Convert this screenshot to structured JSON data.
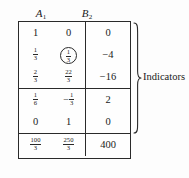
{
  "document": {
    "type": "simplex-tableau",
    "headers": [
      {
        "label": "A",
        "subscript": "1"
      },
      {
        "label": "B",
        "subscript": "2"
      }
    ],
    "annotation": {
      "label": "Indicators",
      "brace_side": "right"
    },
    "sections": [
      {
        "name": "indicator-rows",
        "rows": [
          {
            "a": {
              "text": "1"
            },
            "b": {
              "text": "0"
            },
            "rhs": {
              "text": "0"
            }
          },
          {
            "a": {
              "frac": {
                "num": "1",
                "den": "3"
              }
            },
            "b": {
              "frac": {
                "num": "1",
                "den": "3"
              },
              "circled": true
            },
            "rhs": {
              "text": "−4"
            }
          },
          {
            "a": {
              "frac": {
                "num": "2",
                "den": "3"
              }
            },
            "b": {
              "frac": {
                "num": "22",
                "den": "3"
              }
            },
            "rhs": {
              "text": "−16"
            }
          }
        ]
      },
      {
        "name": "basic-rows",
        "rows": [
          {
            "a": {
              "frac": {
                "num": "1",
                "den": "6"
              }
            },
            "b": {
              "neg": "−",
              "frac": {
                "num": "1",
                "den": "3"
              }
            },
            "rhs": {
              "text": "2"
            }
          },
          {
            "a": {
              "text": "0"
            },
            "b": {
              "text": "1"
            },
            "rhs": {
              "text": "0"
            }
          }
        ]
      },
      {
        "name": "objective-row",
        "rows": [
          {
            "a": {
              "frac": {
                "num": "100",
                "den": "3"
              }
            },
            "b": {
              "frac": {
                "num": "250",
                "den": "3"
              }
            },
            "rhs": {
              "text": "400"
            }
          }
        ]
      }
    ]
  },
  "colors": {
    "ink": "#1a1a1a",
    "rule": "#2a2a2a",
    "paper": "#fdfdfd"
  }
}
